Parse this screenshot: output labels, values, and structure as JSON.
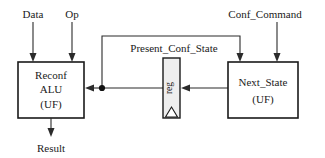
{
  "diagram": {
    "background_color": "#ffffff",
    "line_color": "#2b2b2b",
    "box_border_color": "#1a1a1a",
    "register_fill_color": "#eeeeee",
    "inputs": {
      "data_label": "Data",
      "op_label": "Op",
      "conf_command_label": "Conf_Command"
    },
    "outputs": {
      "result_label": "Result"
    },
    "signals": {
      "present_conf_state_label": "Present_Conf_State"
    },
    "blocks": {
      "alu": {
        "line1": "Reconf",
        "line2": "ALU",
        "line3": "(UF)"
      },
      "register": {
        "label": "reg"
      },
      "next_state": {
        "line1": "Next_State",
        "line2": "(UF)"
      }
    }
  }
}
